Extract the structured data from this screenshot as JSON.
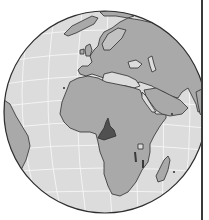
{
  "map": {
    "type": "orthographic-locator-globe",
    "highlighted_country": "Cameroon",
    "visible_regions": [
      "Europe",
      "Africa",
      "Middle East",
      "Arabian Peninsula",
      "Greenland",
      "South America (east coast)",
      "Madagascar"
    ],
    "colors": {
      "background": "#ffffff",
      "ocean": "#dcdcdc",
      "land": "#a9a9a9",
      "highlight": "#505050",
      "coastline": "#2e2e2e",
      "graticule": "#f6f6f6",
      "frame_line": "#3a3a3a"
    },
    "globe": {
      "cx": 105,
      "cy": 112,
      "r": 101
    }
  }
}
